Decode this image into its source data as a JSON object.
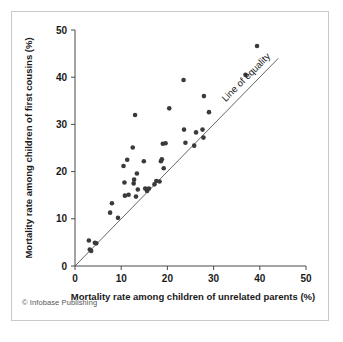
{
  "credit": "© Infobase Publishing",
  "caption_partial": "",
  "colors": {
    "point": "#3a3a3a",
    "axis": "#4a4a4a",
    "line": "#555555",
    "border": "#c9c9c9",
    "text": "#1a1a1a"
  },
  "chart_data": {
    "type": "scatter",
    "title": "",
    "xlabel": "Mortality rate among children of unrelated parents (%)",
    "ylabel": "Mortality rate among children of first cousins (%)",
    "xlim": [
      0,
      50
    ],
    "ylim": [
      0,
      50
    ],
    "xticks": [
      0,
      10,
      20,
      30,
      40,
      50
    ],
    "yticks": [
      0,
      10,
      20,
      30,
      40,
      50
    ],
    "xtick_labels": [
      "0",
      "10",
      "20",
      "30",
      "40",
      "50"
    ],
    "ytick_labels": [
      "0",
      "10",
      "20",
      "30",
      "40",
      "50"
    ],
    "grid": false,
    "legend": false,
    "annotations": [
      {
        "text": "Line of equality",
        "x": 37.5,
        "y": 39.5,
        "rotation": -45
      }
    ],
    "reference_line": {
      "name": "Line of equality",
      "x0": 0,
      "y0": 0,
      "x1": 44,
      "y1": 44
    },
    "series": [
      {
        "name": "Countries",
        "marker": "circle",
        "points": [
          [
            3.0,
            5.4
          ],
          [
            3.2,
            3.5
          ],
          [
            3.5,
            3.2
          ],
          [
            4.3,
            4.9
          ],
          [
            4.6,
            4.8
          ],
          [
            7.6,
            11.3
          ],
          [
            8.0,
            13.3
          ],
          [
            9.3,
            10.2
          ],
          [
            10.5,
            21.2
          ],
          [
            10.7,
            17.7
          ],
          [
            10.8,
            14.9
          ],
          [
            11.3,
            22.5
          ],
          [
            11.6,
            15.1
          ],
          [
            12.5,
            25.1
          ],
          [
            12.7,
            17.5
          ],
          [
            12.8,
            18.3
          ],
          [
            13.0,
            32.0
          ],
          [
            13.2,
            14.7
          ],
          [
            13.4,
            19.6
          ],
          [
            13.6,
            16.2
          ],
          [
            14.9,
            22.2
          ],
          [
            15.2,
            16.4
          ],
          [
            15.6,
            15.9
          ],
          [
            16.0,
            16.4
          ],
          [
            17.2,
            17.3
          ],
          [
            17.6,
            18.0
          ],
          [
            18.3,
            17.9
          ],
          [
            18.6,
            22.2
          ],
          [
            18.8,
            22.6
          ],
          [
            19.0,
            25.9
          ],
          [
            19.2,
            20.7
          ],
          [
            19.6,
            26.0
          ],
          [
            20.4,
            33.4
          ],
          [
            23.5,
            39.4
          ],
          [
            23.6,
            28.9
          ],
          [
            23.9,
            26.1
          ],
          [
            25.8,
            25.5
          ],
          [
            26.2,
            28.3
          ],
          [
            27.6,
            28.9
          ],
          [
            27.8,
            27.2
          ],
          [
            27.9,
            36.0
          ],
          [
            29.0,
            32.6
          ],
          [
            36.9,
            40.5
          ],
          [
            39.4,
            46.6
          ]
        ]
      }
    ]
  }
}
